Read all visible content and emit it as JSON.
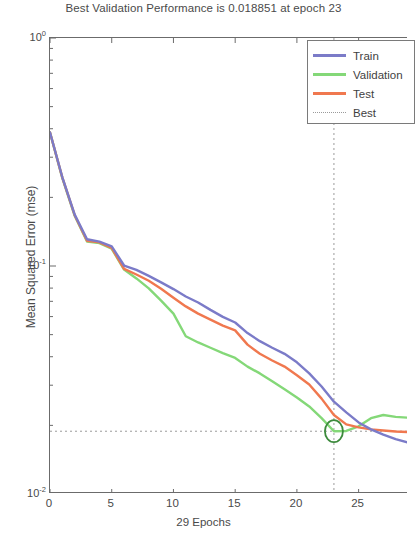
{
  "chart_data": {
    "type": "line",
    "title": "Best Validation Performance is 0.018851 at epoch 23",
    "xlabel": "29 Epochs",
    "ylabel": "Mean Squared Error  (mse)",
    "xlim": [
      0,
      29
    ],
    "ylim": [
      0.01,
      1.0
    ],
    "yscale": "log",
    "grid": false,
    "legend_position": "top-right",
    "xticks": [
      0,
      5,
      10,
      15,
      20,
      25
    ],
    "xtick_labels": [
      "0",
      "5",
      "10",
      "15",
      "20",
      "25"
    ],
    "yticks": [
      1.0,
      0.1,
      0.01
    ],
    "ytick_labels": [
      "10",
      "10",
      "10"
    ],
    "ytick_exponents": [
      "0",
      "-1",
      "-2"
    ],
    "best_epoch": 23,
    "best_value": 0.018851,
    "x": [
      0,
      1,
      2,
      3,
      4,
      5,
      6,
      7,
      8,
      9,
      10,
      11,
      12,
      13,
      14,
      15,
      16,
      17,
      18,
      19,
      20,
      21,
      22,
      23,
      24,
      25,
      26,
      27,
      28,
      29
    ],
    "series": [
      {
        "name": "Train",
        "color": "#7b7bc8",
        "values": [
          0.385,
          0.245,
          0.168,
          0.131,
          0.128,
          0.122,
          0.1005,
          0.0962,
          0.0905,
          0.0848,
          0.0792,
          0.0735,
          0.0692,
          0.0642,
          0.0598,
          0.0565,
          0.0508,
          0.0468,
          0.0438,
          0.0412,
          0.0378,
          0.0338,
          0.0296,
          0.0254,
          0.0228,
          0.0206,
          0.0192,
          0.0182,
          0.0174,
          0.0168
        ]
      },
      {
        "name": "Validation",
        "color": "#84d878",
        "values": [
          0.385,
          0.243,
          0.166,
          0.128,
          0.126,
          0.119,
          0.0965,
          0.0882,
          0.0798,
          0.0705,
          0.0618,
          0.0492,
          0.0462,
          0.0438,
          0.0415,
          0.0395,
          0.0362,
          0.0338,
          0.0312,
          0.0288,
          0.0265,
          0.0242,
          0.0215,
          0.018851,
          0.0189,
          0.0198,
          0.0215,
          0.0222,
          0.0218,
          0.0216
        ]
      },
      {
        "name": "Test",
        "color": "#f0784f",
        "values": [
          0.385,
          0.244,
          0.167,
          0.129,
          0.127,
          0.12,
          0.0972,
          0.0918,
          0.0862,
          0.0795,
          0.0726,
          0.0665,
          0.0618,
          0.0582,
          0.0548,
          0.0522,
          0.0452,
          0.0412,
          0.0385,
          0.0362,
          0.0332,
          0.0302,
          0.0262,
          0.0222,
          0.0202,
          0.0196,
          0.0192,
          0.019,
          0.0188,
          0.0187
        ]
      },
      {
        "name": "Best",
        "color": "#9a9a9a",
        "style": "dotted"
      }
    ],
    "best_marker": {
      "shape": "circle",
      "color": "#3c8a3c",
      "epoch": 23,
      "value": 0.018851
    }
  },
  "legend": {
    "items": [
      {
        "label": "Train",
        "color": "#7b7bc8",
        "style": "solid"
      },
      {
        "label": "Validation",
        "color": "#84d878",
        "style": "solid"
      },
      {
        "label": "Test",
        "color": "#f0784f",
        "style": "solid"
      },
      {
        "label": "Best",
        "color": "#9a9a9a",
        "style": "dotted"
      }
    ]
  }
}
